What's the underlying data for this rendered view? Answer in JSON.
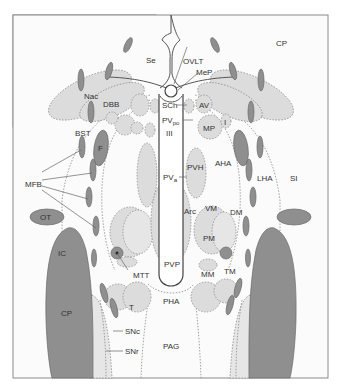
{
  "diagram": {
    "colors": {
      "frame_background": "#fbfbfb",
      "nucleus_light": "#dcdcdc",
      "fiber_dark": "#8f8f8f",
      "outline": "#8a8a8a",
      "text": "#333333"
    },
    "labels": {
      "Se": "Se",
      "OVLT": "OVLT",
      "MeP": "MeP",
      "CP_top": "CP",
      "Nac": "Nac",
      "DBB": "DBB",
      "SCh": "SCh",
      "AV": "AV",
      "PVpo_main": "PV",
      "PVpo_sub": "po",
      "III": "III",
      "MP": "MP",
      "I": "I",
      "BST": "BST",
      "F": "F",
      "PVH": "PVH",
      "AHA": "AHA",
      "LHA": "LHA",
      "SI": "SI",
      "MFB": "MFB",
      "PVa_main": "PV",
      "PVa_sub": "a",
      "Arc": "Arc",
      "VM": "VM",
      "DM": "DM",
      "OT": "OT",
      "PM": "PM",
      "IC": "IC",
      "MTT": "MTT",
      "PVP": "PVP",
      "MM": "MM",
      "TM": "TM",
      "T": "T",
      "PHA": "PHA",
      "CP_bottom": "CP",
      "SNc": "SNc",
      "SNr": "SNr",
      "PAG": "PAG"
    }
  }
}
